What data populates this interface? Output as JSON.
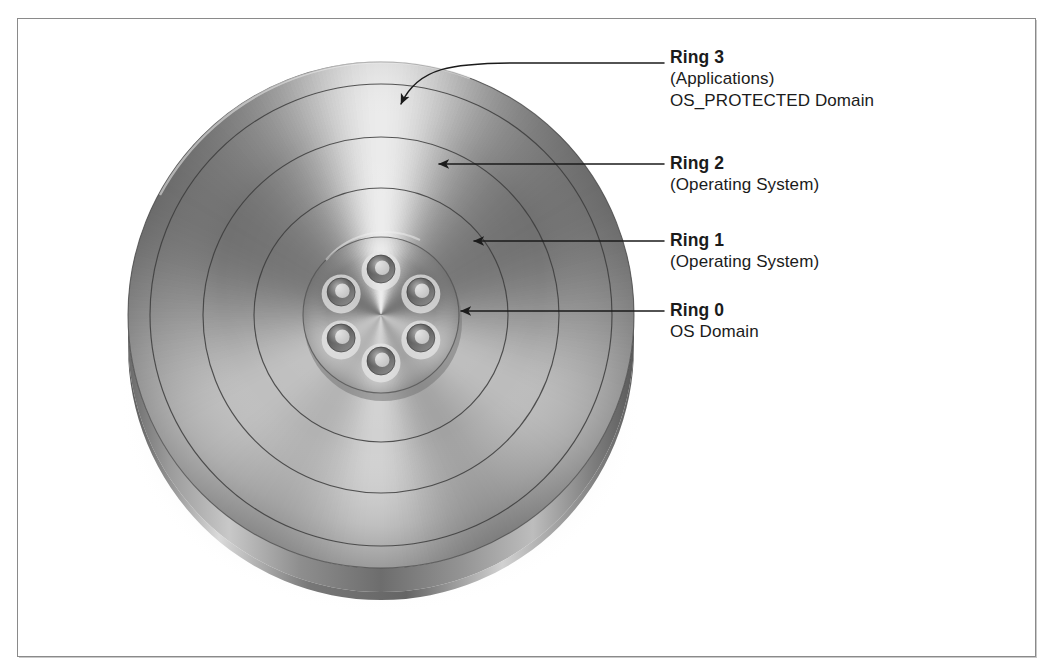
{
  "figure": {
    "kind": "protection-rings-disc-diagram",
    "background_color": "#ffffff",
    "frame_color": "#8a8a8a",
    "text_color": "#1b1b1b",
    "metal_light": "#f2f2f2",
    "metal_mid": "#a9a9a9",
    "metal_dark": "#6e6e6e",
    "metal_darkest": "#4a4a4a"
  },
  "labels": [
    {
      "id": "ring-3",
      "title": "Ring 3",
      "lines": [
        "(Applications)",
        "OS_PROTECTED Domain"
      ],
      "x": 670,
      "y": 46
    },
    {
      "id": "ring-2",
      "title": "Ring 2",
      "lines": [
        "(Operating System)"
      ],
      "x": 670,
      "y": 152
    },
    {
      "id": "ring-1",
      "title": "Ring 1",
      "lines": [
        "(Operating System)"
      ],
      "x": 670,
      "y": 229
    },
    {
      "id": "ring-0",
      "title": "Ring 0",
      "lines": [
        "OS Domain"
      ],
      "x": 670,
      "y": 299
    }
  ],
  "disc": {
    "center_x": 381,
    "center_y": 315,
    "outer_radius": 253,
    "ring_radii": [
      231,
      178,
      127
    ],
    "hub_radius": 78,
    "bolt_hole_count": 6,
    "bolt_circle_radius": 46,
    "bolt_hole_radius": 14,
    "rim_depth": 44
  },
  "leaders": [
    {
      "id": "leader-ring-3",
      "target_x": 401,
      "target_y": 104,
      "tail_x": 664,
      "tail_y": 63,
      "curved": true
    },
    {
      "id": "leader-ring-2",
      "target_x": 439,
      "target_y": 164,
      "tail_x": 664,
      "tail_y": 164,
      "curved": false
    },
    {
      "id": "leader-ring-1",
      "target_x": 474,
      "target_y": 241,
      "tail_x": 664,
      "tail_y": 241,
      "curved": false
    },
    {
      "id": "leader-ring-0",
      "target_x": 461,
      "target_y": 311,
      "tail_x": 664,
      "tail_y": 311,
      "curved": false
    }
  ]
}
